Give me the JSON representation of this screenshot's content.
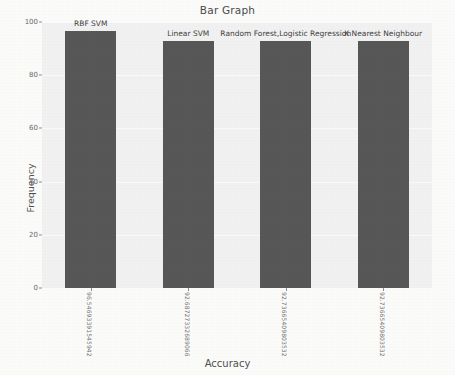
{
  "chart_data": {
    "type": "bar",
    "title": "Bar Graph",
    "xlabel": "Accuracy",
    "ylabel": "Frequency",
    "grid": true,
    "legend": "none",
    "ylim": [
      0,
      100
    ],
    "yticks": [
      "0",
      "20",
      "40",
      "60",
      "80",
      "100"
    ],
    "categories": [
      "96.54693391545942",
      "92.68727332689066",
      "92.73665409803532",
      "92.73665409803532"
    ],
    "values": [
      96.54693391545942,
      92.68727332689066,
      92.73665409803532,
      92.73665409803532
    ],
    "bar_labels": [
      "RBF SVM",
      "Linear SVM",
      "Random Forest,Logistic Regression",
      "K Nearest Neighbour"
    ],
    "colors": {
      "bar": "#575757",
      "plot_background": "#f1f1f1",
      "figure_background": "#fbfbfa",
      "gridline": "#fdfdfd",
      "text": "#4a4a4a"
    }
  }
}
